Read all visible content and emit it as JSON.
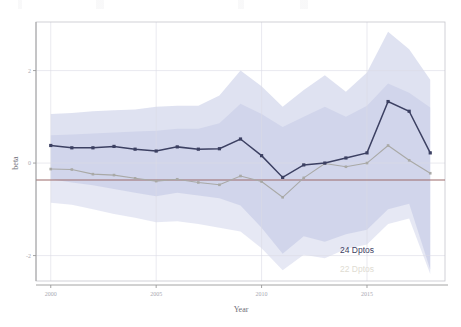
{
  "chart_data": {
    "type": "line",
    "title": "",
    "xlabel": "Year",
    "ylabel": "beta",
    "xlim": [
      1999.3,
      2018.7
    ],
    "ylim": [
      -2.55,
      3.05
    ],
    "xticks": [
      2000,
      2005,
      2010,
      2015
    ],
    "xtick_labels": [
      "2000",
      "2005",
      "2010",
      "2015"
    ],
    "yticks": [
      2,
      0,
      -2
    ],
    "ytick_labels": [
      "2",
      "0",
      "-2"
    ],
    "grid": true,
    "legend_position": "inside-bottom-right",
    "reference_line": {
      "y": 0,
      "color": "#9b6a6a"
    },
    "x": [
      2000,
      2001,
      2002,
      2003,
      2004,
      2005,
      2006,
      2007,
      2008,
      2009,
      2010,
      2011,
      2012,
      2013,
      2014,
      2015,
      2016,
      2017,
      2018
    ],
    "series": [
      {
        "name": "24 Dptos",
        "color": "#3c4062",
        "band_color": "#b9bfe0",
        "values": [
          0.38,
          0.33,
          0.33,
          0.36,
          0.3,
          0.26,
          0.35,
          0.3,
          0.31,
          0.52,
          0.16,
          -0.31,
          -0.04,
          0.0,
          0.11,
          0.22,
          1.33,
          1.12,
          0.22
        ],
        "band_upper": [
          1.06,
          1.08,
          1.12,
          1.14,
          1.16,
          1.22,
          1.24,
          1.24,
          1.46,
          2.0,
          1.66,
          1.22,
          1.58,
          1.9,
          1.54,
          1.96,
          2.84,
          2.46,
          1.8
        ],
        "band_lower": [
          -0.35,
          -0.42,
          -0.48,
          -0.56,
          -0.64,
          -0.72,
          -0.64,
          -0.7,
          -0.76,
          -0.92,
          -1.4,
          -1.96,
          -1.58,
          -1.7,
          -1.54,
          -1.44,
          -1.0,
          -0.88,
          -2.3
        ]
      },
      {
        "name": "22 Dptos",
        "color": "#a9a9a6",
        "band_color": "#c4c8e4",
        "values": [
          -0.13,
          -0.14,
          -0.24,
          -0.26,
          -0.33,
          -0.39,
          -0.35,
          -0.42,
          -0.47,
          -0.28,
          -0.4,
          -0.74,
          -0.32,
          -0.01,
          -0.08,
          0.0,
          0.38,
          0.06,
          -0.22
        ],
        "band_upper": [
          0.6,
          0.62,
          0.64,
          0.66,
          0.68,
          0.7,
          0.74,
          0.74,
          0.86,
          1.28,
          1.06,
          0.78,
          1.0,
          1.22,
          1.0,
          1.24,
          1.72,
          1.52,
          1.2
        ],
        "band_lower": [
          -0.86,
          -0.9,
          -1.0,
          -1.1,
          -1.18,
          -1.28,
          -1.26,
          -1.32,
          -1.4,
          -1.48,
          -1.84,
          -2.32,
          -1.98,
          -2.06,
          -1.86,
          -1.76,
          -1.32,
          -1.2,
          -2.4
        ]
      }
    ],
    "legend": [
      {
        "label": "24 Dptos",
        "color": "#3c4062"
      },
      {
        "label": "22 Dptos",
        "color": "#e0dcd2"
      }
    ]
  }
}
